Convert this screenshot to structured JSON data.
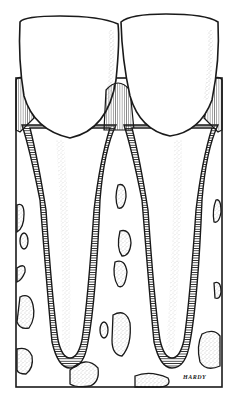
{
  "figure": {
    "signature": "HARDY",
    "colors": {
      "background": "#ffffff",
      "ink": "#1a1a1a",
      "stipple": "#9a9a9a"
    },
    "elements": [
      {
        "name": "left-tooth",
        "parts": [
          "crown",
          "root",
          "periodontal-ligament"
        ]
      },
      {
        "name": "right-tooth",
        "parts": [
          "crown",
          "root",
          "periodontal-ligament"
        ]
      },
      {
        "name": "alveolar-bone",
        "parts": [
          "interdental-septum",
          "marrow-spaces"
        ]
      }
    ]
  }
}
